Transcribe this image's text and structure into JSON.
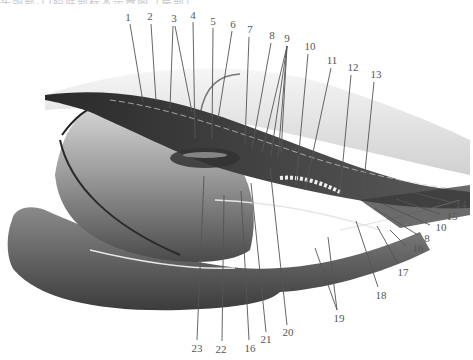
{
  "figure": {
    "caption_cut": "头颈部·口腔底部标本示意图（局部）",
    "colors": {
      "background": "#ffffff",
      "ink": "#2b2b2b",
      "leader": "#555555",
      "label": "#555555"
    }
  },
  "labels": [
    {
      "id": "1",
      "text": "1",
      "x": 128,
      "y": 17
    },
    {
      "id": "2",
      "text": "2",
      "x": 150,
      "y": 16
    },
    {
      "id": "3",
      "text": "3",
      "x": 174,
      "y": 18
    },
    {
      "id": "4",
      "text": "4",
      "x": 193,
      "y": 15
    },
    {
      "id": "5",
      "text": "5",
      "x": 213,
      "y": 21
    },
    {
      "id": "6",
      "text": "6",
      "x": 233,
      "y": 24
    },
    {
      "id": "7",
      "text": "7",
      "x": 250,
      "y": 29
    },
    {
      "id": "8",
      "text": "8",
      "x": 272,
      "y": 35
    },
    {
      "id": "9",
      "text": "9",
      "x": 287,
      "y": 38
    },
    {
      "id": "10",
      "text": "10",
      "x": 310,
      "y": 46
    },
    {
      "id": "11",
      "text": "11",
      "x": 332,
      "y": 60
    },
    {
      "id": "12",
      "text": "12",
      "x": 353,
      "y": 67
    },
    {
      "id": "13",
      "text": "13",
      "x": 376,
      "y": 74
    },
    {
      "id": "14",
      "text": "14",
      "x": 461,
      "y": 204
    },
    {
      "id": "15",
      "text": "15",
      "x": 452,
      "y": 216
    },
    {
      "id": "10b",
      "text": "10",
      "x": 441,
      "y": 227
    },
    {
      "id": "8b",
      "text": "8",
      "x": 427,
      "y": 238
    },
    {
      "id": "16b",
      "text": "16",
      "x": 418,
      "y": 248
    },
    {
      "id": "17",
      "text": "17",
      "x": 403,
      "y": 272
    },
    {
      "id": "18",
      "text": "18",
      "x": 381,
      "y": 295
    },
    {
      "id": "19",
      "text": "19",
      "x": 339,
      "y": 318
    },
    {
      "id": "20",
      "text": "20",
      "x": 288,
      "y": 332
    },
    {
      "id": "21",
      "text": "21",
      "x": 266,
      "y": 339
    },
    {
      "id": "16",
      "text": "16",
      "x": 250,
      "y": 348
    },
    {
      "id": "22",
      "text": "22",
      "x": 221,
      "y": 349
    },
    {
      "id": "23",
      "text": "23",
      "x": 197,
      "y": 348
    }
  ],
  "leaders": [
    {
      "for": "1",
      "x1": 130,
      "y1": 24,
      "x2": 143,
      "y2": 102
    },
    {
      "for": "2",
      "x1": 151,
      "y1": 24,
      "x2": 156,
      "y2": 101
    },
    {
      "for": "3",
      "x1": 173,
      "y1": 26,
      "x2": 170,
      "y2": 108
    },
    {
      "for": "3",
      "x1": 175,
      "y1": 26,
      "x2": 192,
      "y2": 112
    },
    {
      "for": "4",
      "x1": 193,
      "y1": 22,
      "x2": 195,
      "y2": 138
    },
    {
      "for": "5",
      "x1": 213,
      "y1": 28,
      "x2": 212,
      "y2": 139
    },
    {
      "for": "6",
      "x1": 232,
      "y1": 31,
      "x2": 218,
      "y2": 119
    },
    {
      "for": "7",
      "x1": 249,
      "y1": 37,
      "x2": 245,
      "y2": 143
    },
    {
      "for": "8",
      "x1": 271,
      "y1": 43,
      "x2": 252,
      "y2": 148
    },
    {
      "for": "9",
      "x1": 287,
      "y1": 46,
      "x2": 262,
      "y2": 152
    },
    {
      "for": "9",
      "x1": 287,
      "y1": 46,
      "x2": 271,
      "y2": 155
    },
    {
      "for": "9",
      "x1": 287,
      "y1": 46,
      "x2": 278,
      "y2": 158
    },
    {
      "for": "9",
      "x1": 287,
      "y1": 46,
      "x2": 281,
      "y2": 153
    },
    {
      "for": "10",
      "x1": 308,
      "y1": 54,
      "x2": 296,
      "y2": 184
    },
    {
      "for": "11",
      "x1": 331,
      "y1": 68,
      "x2": 305,
      "y2": 190
    },
    {
      "for": "12",
      "x1": 351,
      "y1": 75,
      "x2": 340,
      "y2": 193
    },
    {
      "for": "13",
      "x1": 374,
      "y1": 82,
      "x2": 363,
      "y2": 191
    },
    {
      "for": "14",
      "x1": 450,
      "y1": 202,
      "x2": 400,
      "y2": 189
    },
    {
      "for": "15",
      "x1": 440,
      "y1": 214,
      "x2": 396,
      "y2": 199
    },
    {
      "for": "10b",
      "x1": 430,
      "y1": 225,
      "x2": 383,
      "y2": 204
    },
    {
      "for": "8b",
      "x1": 418,
      "y1": 235,
      "x2": 374,
      "y2": 208
    },
    {
      "for": "16b",
      "x1": 406,
      "y1": 246,
      "x2": 390,
      "y2": 230
    },
    {
      "for": "17",
      "x1": 398,
      "y1": 264,
      "x2": 377,
      "y2": 226
    },
    {
      "for": "18",
      "x1": 378,
      "y1": 287,
      "x2": 356,
      "y2": 221
    },
    {
      "for": "19",
      "x1": 337,
      "y1": 310,
      "x2": 315,
      "y2": 248
    },
    {
      "for": "19",
      "x1": 337,
      "y1": 310,
      "x2": 328,
      "y2": 237
    },
    {
      "for": "20",
      "x1": 287,
      "y1": 325,
      "x2": 270,
      "y2": 168
    },
    {
      "for": "21",
      "x1": 266,
      "y1": 332,
      "x2": 251,
      "y2": 183
    },
    {
      "for": "16",
      "x1": 249,
      "y1": 340,
      "x2": 241,
      "y2": 191
    },
    {
      "for": "22",
      "x1": 222,
      "y1": 341,
      "x2": 224,
      "y2": 195
    },
    {
      "for": "23",
      "x1": 197,
      "y1": 340,
      "x2": 204,
      "y2": 176
    }
  ]
}
